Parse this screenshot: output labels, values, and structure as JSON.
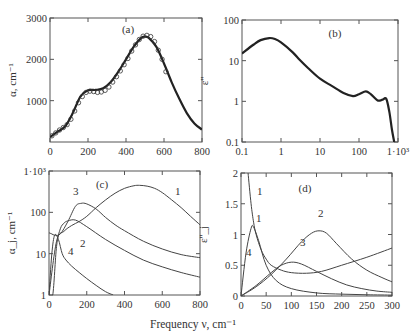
{
  "figure": {
    "shared_xlabel": "Frequency ν, cm⁻¹"
  },
  "chart_data": [
    {
      "panel": "(a)",
      "type": "line",
      "title": "(a)",
      "xlabel": "",
      "ylabel": "α, cm⁻¹",
      "xlim": [
        0,
        800
      ],
      "ylim": [
        0,
        3000
      ],
      "xticks": [
        "0",
        "200",
        "400",
        "600",
        "800"
      ],
      "yticks": [
        "1000",
        "2000",
        "3000"
      ],
      "series": [
        {
          "name": "fit (solid line)",
          "style": "line",
          "x": [
            0,
            40,
            80,
            120,
            160,
            200,
            240,
            280,
            320,
            360,
            400,
            440,
            480,
            500,
            520,
            560,
            600,
            640,
            680,
            720,
            760,
            800
          ],
          "y": [
            120,
            250,
            380,
            700,
            1100,
            1250,
            1260,
            1300,
            1450,
            1700,
            2000,
            2300,
            2520,
            2550,
            2520,
            2300,
            1900,
            1450,
            1050,
            700,
            450,
            300
          ]
        },
        {
          "name": "experiment (circles)",
          "style": "markers",
          "x": [
            10,
            30,
            50,
            70,
            90,
            110,
            130,
            150,
            170,
            190,
            210,
            230,
            250,
            270,
            290,
            310,
            330,
            350,
            370,
            390,
            410,
            430,
            450,
            470,
            490,
            510,
            530,
            550,
            570,
            590,
            610
          ],
          "y": [
            150,
            220,
            290,
            350,
            420,
            550,
            750,
            950,
            1100,
            1200,
            1230,
            1220,
            1200,
            1210,
            1250,
            1330,
            1450,
            1580,
            1720,
            1870,
            2020,
            2200,
            2350,
            2480,
            2560,
            2580,
            2550,
            2430,
            2220,
            2000,
            1700
          ]
        }
      ]
    },
    {
      "panel": "(b)",
      "type": "line",
      "title": "(b)",
      "xlabel": "",
      "ylabel": "ε''",
      "xscale": "log",
      "yscale": "log",
      "xlim": [
        0.1,
        1000
      ],
      "ylim": [
        0.1,
        100
      ],
      "xticks": [
        "0.1",
        "1",
        "10",
        "100",
        "1·10³"
      ],
      "yticks": [
        "0.1",
        "1",
        "10",
        "100"
      ],
      "series": [
        {
          "name": "ε''",
          "x": [
            0.1,
            0.2,
            0.3,
            0.5,
            0.7,
            1,
            2,
            3,
            5,
            10,
            20,
            40,
            70,
            100,
            150,
            200,
            300,
            400,
            500,
            600,
            700,
            800
          ],
          "y": [
            15,
            25,
            32,
            36,
            34,
            28,
            16,
            10.5,
            6.5,
            3.6,
            2.4,
            1.6,
            1.35,
            1.5,
            1.75,
            1.5,
            1.05,
            1.1,
            1.15,
            0.55,
            0.2,
            0.1
          ]
        }
      ]
    },
    {
      "panel": "(c)",
      "type": "line",
      "title": "(c)",
      "xlabel": "Frequency ν, cm⁻¹",
      "ylabel": "α_j, cm⁻¹",
      "yscale": "log",
      "xlim": [
        0,
        800
      ],
      "ylim": [
        1,
        1000
      ],
      "xticks": [
        "0",
        "200",
        "400",
        "600",
        "800"
      ],
      "yticks": [
        "1",
        "10",
        "100",
        "1·10³"
      ],
      "series": [
        {
          "name": "1",
          "x": [
            0,
            40,
            80,
            120,
            160,
            200,
            250,
            300,
            350,
            400,
            450,
            480,
            520,
            560,
            600,
            650,
            700,
            750,
            800
          ],
          "y": [
            1,
            20,
            35,
            48,
            60,
            80,
            130,
            200,
            290,
            380,
            440,
            450,
            430,
            380,
            300,
            200,
            130,
            80,
            50
          ]
        },
        {
          "name": "2",
          "x": [
            0,
            20,
            40,
            60,
            80,
            100,
            140,
            200,
            300,
            400,
            500,
            600,
            700,
            800
          ],
          "y": [
            1,
            1,
            15,
            40,
            55,
            62,
            65,
            45,
            22,
            12,
            7,
            4.8,
            3.5,
            2.7
          ]
        },
        {
          "name": "3",
          "x": [
            0,
            15,
            30,
            60,
            100,
            140,
            170,
            200,
            250,
            300,
            350,
            400,
            500,
            600,
            700,
            800
          ],
          "y": [
            32,
            30,
            28,
            30,
            60,
            140,
            165,
            160,
            120,
            75,
            50,
            36,
            20,
            13,
            9.5,
            8
          ]
        },
        {
          "name": "4",
          "x": [
            0,
            15,
            30,
            50,
            70,
            90,
            120,
            160,
            200,
            250,
            300,
            340
          ],
          "y": [
            1,
            10,
            28,
            22,
            10,
            7,
            5,
            3.5,
            2.5,
            1.7,
            1.2,
            1
          ]
        }
      ]
    },
    {
      "panel": "(d)",
      "type": "line",
      "title": "(d)",
      "xlabel": "Frequency ν, cm⁻¹",
      "ylabel": "ε''_j",
      "xlim": [
        0,
        300
      ],
      "ylim": [
        0,
        2
      ],
      "xticks": [
        "0",
        "50",
        "100",
        "150",
        "200",
        "250",
        "300"
      ],
      "yticks": [
        "0",
        "0.5",
        "1",
        "1.5",
        "2"
      ],
      "series": [
        {
          "name": "1",
          "x": [
            14,
            20,
            25,
            30,
            40,
            50,
            60,
            80,
            100,
            130,
            160,
            200,
            250,
            300
          ],
          "y": [
            2.0,
            1.5,
            1.2,
            1.0,
            0.75,
            0.6,
            0.5,
            0.42,
            0.38,
            0.37,
            0.4,
            0.5,
            0.63,
            0.78
          ]
        },
        {
          "name": "2",
          "x": [
            0,
            30,
            60,
            90,
            120,
            140,
            155,
            170,
            190,
            220,
            250,
            280,
            300
          ],
          "y": [
            0,
            0.15,
            0.35,
            0.6,
            0.88,
            1.02,
            1.06,
            1.02,
            0.85,
            0.6,
            0.42,
            0.3,
            0.23
          ]
        },
        {
          "name": "3",
          "x": [
            0,
            30,
            60,
            80,
            100,
            120,
            150,
            180,
            210,
            240,
            270,
            300
          ],
          "y": [
            0,
            0.17,
            0.38,
            0.5,
            0.55,
            0.52,
            0.4,
            0.28,
            0.18,
            0.12,
            0.08,
            0.06
          ]
        },
        {
          "name": "4",
          "x": [
            0,
            10,
            20,
            25,
            35,
            50,
            70,
            100,
            150,
            200,
            250,
            300
          ],
          "y": [
            0,
            0.7,
            1.1,
            1.12,
            0.9,
            0.5,
            0.25,
            0.12,
            0.05,
            0.03,
            0.02,
            0.015
          ]
        }
      ]
    }
  ]
}
